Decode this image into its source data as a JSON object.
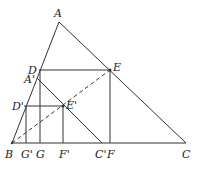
{
  "diagram": {
    "type": "geometry",
    "colors": {
      "line": "#333333",
      "background": "#ffffff"
    },
    "points": {
      "A": {
        "label": "A",
        "x": 59,
        "y": 22
      },
      "B": {
        "label": "B",
        "x": 12,
        "y": 143
      },
      "C": {
        "label": "C",
        "x": 186,
        "y": 143
      },
      "D": {
        "label": "D",
        "x": 39,
        "y": 70
      },
      "E": {
        "label": "E",
        "x": 110,
        "y": 70
      },
      "F": {
        "label": "F",
        "x": 110,
        "y": 143
      },
      "G": {
        "label": "G",
        "x": 40,
        "y": 143
      },
      "A1": {
        "label": "A'",
        "x": 37,
        "y": 78
      },
      "C1": {
        "label": "C'",
        "x": 102,
        "y": 143
      },
      "D1": {
        "label": "D'",
        "x": 24,
        "y": 106
      },
      "E1": {
        "label": "E'",
        "x": 63,
        "y": 106
      },
      "F1": {
        "label": "F'",
        "x": 63,
        "y": 143
      },
      "G1": {
        "label": "G'",
        "x": 26,
        "y": 143
      }
    },
    "labels": {
      "A": "A",
      "B": "B",
      "C": "C",
      "D": "D",
      "E": "E",
      "F": "F",
      "G": "G",
      "A1": "A'",
      "C1": "C'",
      "D1": "D'",
      "E1": "E'",
      "F1": "F'",
      "G1": "G'"
    },
    "segments_solid": [
      "AB",
      "BC",
      "CA",
      "DE",
      "EF",
      "DG",
      "A1C1",
      "D1E1",
      "E1F1",
      "D1G1"
    ],
    "segments_dashed": [
      "BE"
    ]
  }
}
